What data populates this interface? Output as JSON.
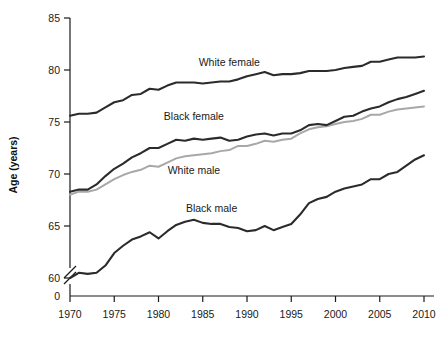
{
  "chart_data": {
    "type": "line",
    "title": "",
    "xlabel": "",
    "ylabel": "Age (years)",
    "xlim": [
      1970,
      2010
    ],
    "ylim": [
      58.5,
      85
    ],
    "grid": false,
    "legend_position": "inline-annotations",
    "axis_break": true,
    "axis_break_note": "y-axis broken between 0 and 60",
    "xticks": [
      1970,
      1975,
      1980,
      1985,
      1990,
      1995,
      2000,
      2005,
      2010
    ],
    "xtick_labels": [
      "1970",
      "1975",
      "1980",
      "1985",
      "1990",
      "1995",
      "2000",
      "2005",
      "2010"
    ],
    "yticks": [
      0,
      60,
      65,
      70,
      75,
      80,
      85
    ],
    "ytick_labels": [
      "0",
      "60",
      "65",
      "70",
      "75",
      "80",
      "85"
    ],
    "x": [
      1970,
      1971,
      1972,
      1973,
      1974,
      1975,
      1976,
      1977,
      1978,
      1979,
      1980,
      1981,
      1982,
      1983,
      1984,
      1985,
      1986,
      1987,
      1988,
      1989,
      1990,
      1991,
      1992,
      1993,
      1994,
      1995,
      1996,
      1997,
      1998,
      1999,
      2000,
      2001,
      2002,
      2003,
      2004,
      2005,
      2006,
      2007,
      2008,
      2009,
      2010
    ],
    "series": [
      {
        "name": "White female",
        "color": "#2b2b2b",
        "label_x": 1988,
        "label_y": 80.4,
        "values": [
          75.6,
          75.8,
          75.8,
          75.9,
          76.4,
          76.9,
          77.1,
          77.6,
          77.7,
          78.2,
          78.1,
          78.5,
          78.8,
          78.8,
          78.8,
          78.7,
          78.8,
          78.9,
          78.9,
          79.1,
          79.4,
          79.6,
          79.8,
          79.5,
          79.6,
          79.6,
          79.7,
          79.9,
          79.9,
          79.9,
          80.0,
          80.2,
          80.3,
          80.4,
          80.8,
          80.8,
          81.0,
          81.2,
          81.2,
          81.2,
          81.3
        ]
      },
      {
        "name": "Black female",
        "color": "#2b2b2b",
        "label_x": 1984,
        "label_y": 75.2,
        "values": [
          68.3,
          68.5,
          68.5,
          69.0,
          69.8,
          70.5,
          71.0,
          71.6,
          72.0,
          72.5,
          72.5,
          72.9,
          73.3,
          73.2,
          73.4,
          73.3,
          73.4,
          73.5,
          73.2,
          73.3,
          73.6,
          73.8,
          73.9,
          73.7,
          73.9,
          73.9,
          74.2,
          74.7,
          74.8,
          74.7,
          75.1,
          75.5,
          75.6,
          76.0,
          76.3,
          76.5,
          76.9,
          77.2,
          77.4,
          77.7,
          78.0
        ]
      },
      {
        "name": "White male",
        "color": "#a8a8a8",
        "label_x": 1984,
        "label_y": 70.0,
        "values": [
          68.0,
          68.3,
          68.3,
          68.5,
          69.0,
          69.5,
          69.9,
          70.2,
          70.4,
          70.8,
          70.7,
          71.1,
          71.5,
          71.7,
          71.8,
          71.9,
          72.0,
          72.2,
          72.3,
          72.7,
          72.7,
          72.9,
          73.2,
          73.1,
          73.3,
          73.4,
          73.9,
          74.3,
          74.5,
          74.6,
          74.8,
          75.0,
          75.1,
          75.3,
          75.7,
          75.7,
          76.0,
          76.2,
          76.3,
          76.4,
          76.5
        ]
      },
      {
        "name": "Black male",
        "color": "#2b2b2b",
        "label_x": 1986,
        "label_y": 66.3,
        "values": [
          60.0,
          60.5,
          60.4,
          60.5,
          61.2,
          62.4,
          63.1,
          63.7,
          64.0,
          64.4,
          63.8,
          64.5,
          65.1,
          65.4,
          65.6,
          65.3,
          65.2,
          65.2,
          64.9,
          64.8,
          64.5,
          64.6,
          65.0,
          64.6,
          64.9,
          65.2,
          66.1,
          67.2,
          67.6,
          67.8,
          68.3,
          68.6,
          68.8,
          69.0,
          69.5,
          69.5,
          70.0,
          70.2,
          70.8,
          71.4,
          71.8
        ]
      }
    ]
  },
  "axis": {
    "y_title": "Age (years)"
  }
}
